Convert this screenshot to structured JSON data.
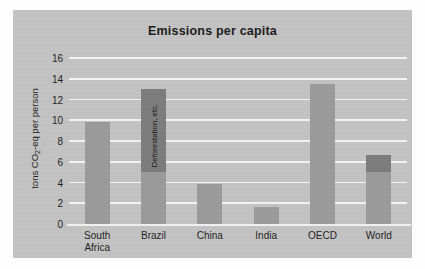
{
  "chart_data": {
    "type": "bar",
    "title": "Emissions per capita",
    "xlabel": "",
    "ylabel": "tons CO2-eq per person",
    "ylabel_parts": {
      "pre": "tons CO",
      "sub": "2",
      "post": "-eq per person"
    },
    "categories": [
      "South Africa",
      "Brazil",
      "China",
      "India",
      "OECD",
      "World"
    ],
    "category_lines": [
      [
        "South",
        "Africa"
      ],
      [
        "Brazil"
      ],
      [
        "China"
      ],
      [
        "India"
      ],
      [
        "OECD"
      ],
      [
        "World"
      ]
    ],
    "values": [
      9.8,
      13.0,
      3.9,
      1.6,
      13.5,
      6.7
    ],
    "series": [
      {
        "name": "Fossil fuel and other emissions",
        "values": [
          9.8,
          5.0,
          3.9,
          1.6,
          13.5,
          5.0
        ],
        "color": "#9a9a9a"
      },
      {
        "name": "Deforestation, etc.",
        "values": [
          0,
          8.0,
          0,
          0,
          0,
          1.7
        ],
        "color": "#7c7c7c"
      }
    ],
    "annotations": [
      {
        "category": "Brazil",
        "text": "Deforestation, etc.",
        "orientation": "vertical"
      }
    ],
    "ylim": [
      0,
      16
    ],
    "yticks": [
      0,
      2,
      4,
      6,
      8,
      10,
      12,
      14,
      16
    ],
    "grid": true,
    "gridline_color": "#f3f3f3",
    "legend": "none",
    "background_color": "#c3c3c3",
    "page_color": "#fdfdfd",
    "text_color": "#1d1d1d"
  }
}
